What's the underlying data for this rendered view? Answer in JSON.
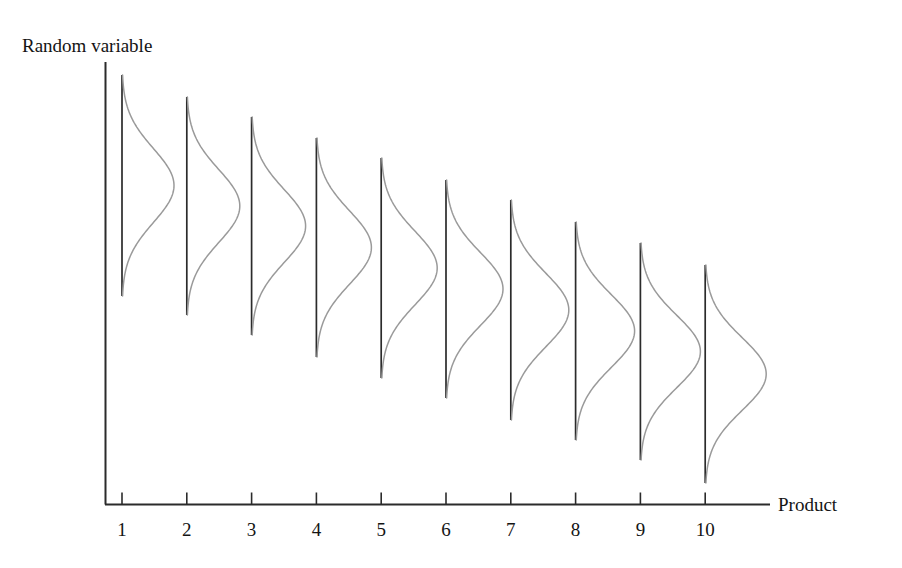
{
  "chart_data": {
    "type": "line",
    "title": "",
    "subtitle": "",
    "xlabel": "Product",
    "ylabel": "Random variable",
    "grid": false,
    "legend": null,
    "annotations": [],
    "x": [
      1,
      2,
      3,
      4,
      5,
      6,
      7,
      8,
      9,
      10
    ],
    "categories": [
      "1",
      "2",
      "3",
      "4",
      "5",
      "6",
      "7",
      "8",
      "9",
      "10"
    ],
    "xtick_labels": [
      "1",
      "2",
      "3",
      "4",
      "5",
      "6",
      "7",
      "8",
      "9",
      "10"
    ],
    "ytick_labels": [],
    "xlim": [
      0.6,
      11.2
    ],
    "ylim": [
      0,
      10
    ],
    "series": [
      {
        "name": "Random variable distribution",
        "style": "density-curve",
        "color": "#9a9a9a",
        "baseline_color": "#2b2b2b",
        "mean": [
          7.55,
          7.33,
          7.1,
          6.88,
          6.66,
          6.44,
          6.21,
          5.99,
          5.77,
          5.55
        ],
        "spread": [
          0.9,
          0.92,
          0.94,
          0.96,
          0.98,
          1.0,
          1.02,
          1.04,
          1.06,
          1.08
        ],
        "amplitude": [
          52,
          53,
          54,
          55,
          56,
          57,
          58,
          59,
          60,
          61
        ],
        "curve_top": [
          75,
          97,
          117,
          138,
          158,
          180,
          200,
          222,
          243,
          265
        ],
        "curve_bottom": [
          296,
          315,
          335,
          357,
          378,
          398,
          420,
          440,
          460,
          483
        ]
      }
    ]
  },
  "figure": {
    "y_axis_label": "Random variable",
    "x_axis_label": "Product",
    "axis_color": "#2b2b2b",
    "curve_color": "#9a9a9a",
    "background": "#ffffff"
  }
}
